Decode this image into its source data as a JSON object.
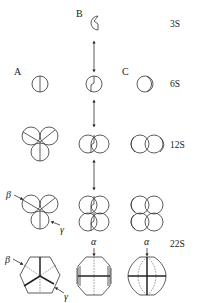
{
  "figure": {
    "columns": [
      {
        "id": "A",
        "label": "A"
      },
      {
        "id": "B",
        "label": "B"
      },
      {
        "id": "C",
        "label": "C"
      }
    ],
    "rows": [
      {
        "label": "3S"
      },
      {
        "label": "6S"
      },
      {
        "label": "12S"
      },
      {
        "label": "22S"
      }
    ],
    "greek": {
      "alpha": "α",
      "beta": "β",
      "gamma": "γ"
    }
  }
}
